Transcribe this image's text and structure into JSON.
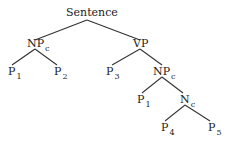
{
  "tree": {
    "root": {
      "label": "Sentence"
    },
    "nodes": [
      {
        "id": "sentence",
        "label": "Sentence",
        "sub": ""
      },
      {
        "id": "npc1",
        "label": "NP",
        "sub": "c"
      },
      {
        "id": "vp",
        "label": "VP",
        "sub": ""
      },
      {
        "id": "p1a",
        "label": "P",
        "sub": "1"
      },
      {
        "id": "p2",
        "label": "P",
        "sub": "2"
      },
      {
        "id": "p3",
        "label": "P",
        "sub": "3"
      },
      {
        "id": "npc2",
        "label": "NP",
        "sub": "c"
      },
      {
        "id": "p1b",
        "label": "P",
        "sub": "1"
      },
      {
        "id": "nc",
        "label": "N",
        "sub": "c"
      },
      {
        "id": "p4",
        "label": "P",
        "sub": "4"
      },
      {
        "id": "p5",
        "label": "P",
        "sub": "5"
      }
    ],
    "edges": [
      [
        "sentence",
        "npc1"
      ],
      [
        "sentence",
        "vp"
      ],
      [
        "npc1",
        "p1a"
      ],
      [
        "npc1",
        "p2"
      ],
      [
        "vp",
        "p3"
      ],
      [
        "vp",
        "npc2"
      ],
      [
        "npc2",
        "p1b"
      ],
      [
        "npc2",
        "nc"
      ],
      [
        "nc",
        "p4"
      ],
      [
        "nc",
        "p5"
      ]
    ]
  }
}
